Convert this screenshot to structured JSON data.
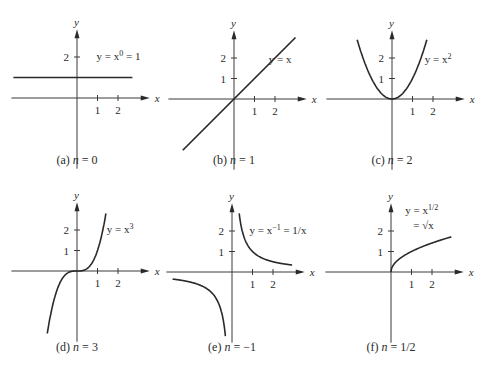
{
  "figure": {
    "panels": [
      {
        "id": "a",
        "caption_prefix": "(a)",
        "caption_var": "n",
        "caption_value": "= 0",
        "equation": "y = x⁰ = 1",
        "eq_main": "y = x",
        "eq_sup": "0",
        "eq_tail": " = 1",
        "origin": [
          77,
          98
        ]
      },
      {
        "id": "b",
        "caption_prefix": "(b)",
        "caption_var": "n",
        "caption_value": "= 1",
        "equation": "y = x",
        "eq_main": "y = x",
        "eq_sup": "",
        "eq_tail": "",
        "origin": [
          234,
          99
        ]
      },
      {
        "id": "c",
        "caption_prefix": "(c)",
        "caption_var": "n",
        "caption_value": "= 2",
        "equation": "y = x²",
        "eq_main": "y = x",
        "eq_sup": "2",
        "eq_tail": "",
        "origin": [
          392,
          99
        ]
      },
      {
        "id": "d",
        "caption_prefix": "(d)",
        "caption_var": "n",
        "caption_value": "= 3",
        "equation": "y = x³",
        "eq_main": "y = x",
        "eq_sup": "3",
        "eq_tail": "",
        "origin": [
          77,
          271
        ]
      },
      {
        "id": "e",
        "caption_prefix": "(e)",
        "caption_var": "n",
        "caption_value": "= −1",
        "equation": "y = x⁻¹ = 1/x",
        "eq_main": "y = x",
        "eq_sup": "−1",
        "eq_tail": " = 1/x",
        "origin": [
          232,
          272
        ]
      },
      {
        "id": "f",
        "caption_prefix": "(f)",
        "caption_var": "n",
        "caption_value": "= 1/2",
        "equation": "y = x^(1/2) = √x",
        "eq_main": "y = x",
        "eq_sup": "1/2",
        "eq_tail": "",
        "eq_line2": "= √x",
        "origin": [
          391,
          272
        ]
      }
    ],
    "axis_labels": {
      "x": "x",
      "y": "y"
    },
    "tick_labels": {
      "x1": "1",
      "x2": "2",
      "y1": "1",
      "y2": "2"
    },
    "unit_px": 20.5,
    "colors": {
      "ink": "#2a2a2a",
      "background": "#ffffff"
    }
  }
}
